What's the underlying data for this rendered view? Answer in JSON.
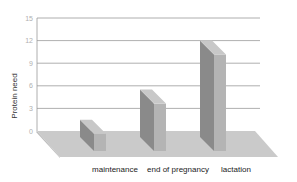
{
  "chart_data": {
    "type": "bar",
    "style": "3d",
    "title": "",
    "xlabel": "",
    "ylabel": "Protein need",
    "categories": [
      "maintenance",
      "end of pregnancy",
      "lactation"
    ],
    "values": [
      1.5,
      5.5,
      12
    ],
    "ylim": [
      0,
      15
    ],
    "yticks": [
      "0",
      "3",
      "6",
      "9",
      "12",
      "15"
    ],
    "grid": true,
    "legend": null,
    "colors": {
      "bar_front": "#8a8a8a",
      "bar_side": "#b4b4b4",
      "bar_top": "#c8c8c8",
      "floor": "#c9c9c9",
      "grid": "#9a9a9a"
    }
  }
}
